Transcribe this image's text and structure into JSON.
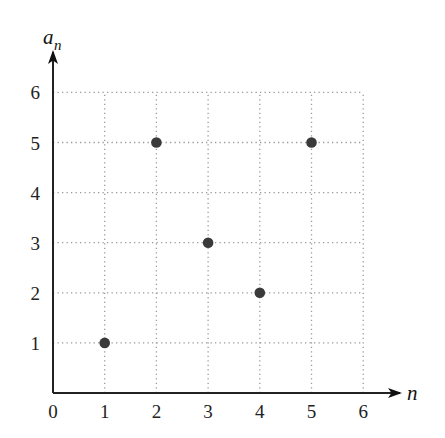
{
  "chart_data": {
    "type": "scatter",
    "title": "",
    "xlabel": "n",
    "ylabel": "a_n",
    "ylabel_main": "a",
    "ylabel_sub": "n",
    "x": [
      1,
      2,
      3,
      4,
      5
    ],
    "series": [
      {
        "name": "a_n",
        "points": [
          {
            "x": 1,
            "y": 1
          },
          {
            "x": 2,
            "y": 5
          },
          {
            "x": 3,
            "y": 3
          },
          {
            "x": 4,
            "y": 2
          },
          {
            "x": 5,
            "y": 5
          }
        ],
        "values": [
          1,
          5,
          3,
          2,
          5
        ]
      }
    ],
    "x_ticks": [
      "0",
      "1",
      "2",
      "3",
      "4",
      "5",
      "6"
    ],
    "y_ticks": [
      "1",
      "2",
      "3",
      "4",
      "5",
      "6"
    ],
    "xlim": [
      0,
      6
    ],
    "ylim": [
      0,
      6
    ],
    "grid": true,
    "grid_style": "dotted",
    "legend": null
  },
  "colors": {
    "axis": "#222222",
    "grid": "#9a9a9a",
    "point": "#3a3a3a",
    "text": "#222222"
  }
}
